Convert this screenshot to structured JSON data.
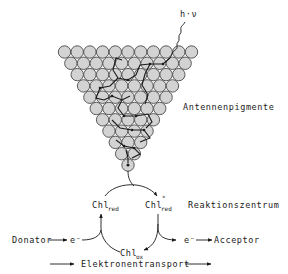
{
  "diagram": {
    "photon_label": "h·ν",
    "antenna_label": "Antennenpigmente",
    "reaction_center_label": "Reaktionszentrum",
    "chl_red": {
      "base": "Chl",
      "sub": "red"
    },
    "chl_red_excited": {
      "base": "Chl",
      "sup": "*",
      "sub": "red"
    },
    "chl_ox": {
      "base": "Chl",
      "sub": "ox"
    },
    "donor_label": "Donator",
    "electron_in": "e⁻",
    "electron_out": "e⁻",
    "acceptor_label": "Acceptor",
    "transport_label": "Elektronentransport",
    "antenna": {
      "rows": [
        11,
        10,
        9,
        8,
        7,
        6,
        5,
        4,
        3,
        2,
        1
      ],
      "fill_color": "#d3d3d3",
      "stroke_color": "#4a4a4a"
    }
  }
}
